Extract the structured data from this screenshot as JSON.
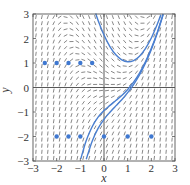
{
  "chart_data": {
    "type": "line",
    "title": "",
    "xlabel": "x",
    "ylabel": "y",
    "xlim": [
      -3,
      3
    ],
    "ylim": [
      -3,
      3
    ],
    "x_ticks": [
      -3,
      -2,
      -1,
      0,
      1,
      2,
      3
    ],
    "y_ticks": [
      -3,
      -2,
      -1,
      0,
      1,
      2,
      3
    ],
    "x_tick_labels": [
      "−3",
      "−2",
      "−1",
      "0",
      "1",
      "2",
      "3"
    ],
    "y_tick_labels": [
      "−3",
      "−2",
      "−1",
      "0",
      "1",
      "2",
      "3"
    ],
    "grid": false,
    "legend": null,
    "slope_field": {
      "equation": "dy/dx = x^2 - y",
      "x_start": -2.875,
      "y_start": -2.875,
      "step": 0.25,
      "count_x": 24,
      "count_y": 24,
      "segment_length": 0.17,
      "color": "#555555"
    },
    "series": [
      {
        "name": "solution curve 1",
        "color": "#4a7fd0",
        "points": [
          [
            -0.35,
            3.02
          ],
          [
            -0.2,
            2.61
          ],
          [
            0,
            2.14
          ],
          [
            0.25,
            1.67
          ],
          [
            0.5,
            1.335
          ],
          [
            0.75,
            1.13
          ],
          [
            1.0,
            1.05
          ],
          [
            1.25,
            1.1
          ],
          [
            1.5,
            1.28
          ],
          [
            1.75,
            1.59
          ],
          [
            2.0,
            2.02
          ],
          [
            2.25,
            2.58
          ],
          [
            2.4,
            2.97
          ]
        ]
      },
      {
        "name": "solution curve 2",
        "color": "#4a7fd0",
        "points": [
          [
            -0.98,
            -2.91
          ],
          [
            -0.75,
            -2.16
          ],
          [
            -0.5,
            -1.6
          ],
          [
            -0.25,
            -1.21
          ],
          [
            0,
            -0.94
          ],
          [
            0.25,
            -0.73
          ],
          [
            0.5,
            -0.53
          ],
          [
            0.75,
            -0.33
          ],
          [
            1.0,
            -0.08
          ],
          [
            1.25,
            0.22
          ],
          [
            1.5,
            0.59
          ],
          [
            1.75,
            1.05
          ],
          [
            2.0,
            1.6
          ],
          [
            2.25,
            2.25
          ],
          [
            2.5,
            3.0
          ]
        ]
      },
      {
        "name": "solution curve 3",
        "color": "#4a7fd0",
        "points": [
          [
            -0.75,
            -2.93
          ],
          [
            -0.5,
            -2.19
          ],
          [
            -0.25,
            -1.67
          ],
          [
            0,
            -1.3
          ],
          [
            0.25,
            -1.01
          ],
          [
            0.5,
            -0.75
          ],
          [
            0.75,
            -0.5
          ],
          [
            1.0,
            -0.21
          ],
          [
            1.25,
            0.12
          ],
          [
            1.5,
            0.51
          ],
          [
            1.75,
            0.99
          ],
          [
            2.0,
            1.55
          ],
          [
            2.25,
            2.21
          ],
          [
            2.5,
            2.98
          ]
        ]
      }
    ],
    "marked_points": {
      "color": "#3f78d0",
      "points": [
        [
          -2.5,
          1
        ],
        [
          -2,
          1
        ],
        [
          -1.5,
          1
        ],
        [
          -1,
          1
        ],
        [
          -0.5,
          1
        ],
        [
          -2,
          -2
        ],
        [
          -1.5,
          -2
        ],
        [
          -1,
          -2
        ],
        [
          0,
          -2
        ],
        [
          1,
          -2
        ],
        [
          2,
          -2
        ]
      ]
    }
  },
  "layout": {
    "plot_left": 33,
    "plot_right": 175,
    "plot_top": 14,
    "plot_bottom": 161
  }
}
